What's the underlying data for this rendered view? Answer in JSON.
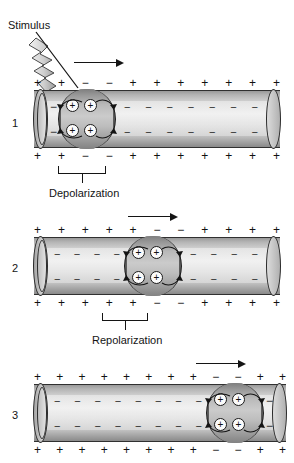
{
  "figure": {
    "stimulus_label": "Stimulus",
    "icons": {
      "lightning": "lightning-bolt-icon",
      "arrow": "right-arrow-icon",
      "ion": "positive-ion-icon"
    },
    "colors": {
      "ink": "#141414",
      "membrane_outline": "#2b2b2b",
      "tube_light": "#efefef",
      "tube_dark": "#8a8a8a",
      "band_dark": "#7e7e7e"
    }
  },
  "panels": [
    {
      "number": "1",
      "region_label": "Depolarization",
      "outside_top": [
        "+",
        "+",
        "−",
        "−",
        "+",
        "+",
        "+",
        "+",
        "+",
        "+",
        "+"
      ],
      "outside_bottom": [
        "+",
        "+",
        "−",
        "−",
        "+",
        "+",
        "+",
        "+",
        "+",
        "+",
        "+"
      ],
      "inside_left_sign": "−",
      "inside_right_sign": "−",
      "ions_top": [
        "+",
        "+"
      ],
      "ions_bottom": [
        "+",
        "+"
      ],
      "direction": "right",
      "has_stimulus": true,
      "band_start_index": 2,
      "band_end_index": 4
    },
    {
      "number": "2",
      "region_label": "Repolarization",
      "outside_top": [
        "+",
        "+",
        "+",
        "+",
        "+",
        "−",
        "−",
        "+",
        "+",
        "+",
        "+"
      ],
      "outside_bottom": [
        "+",
        "+",
        "+",
        "+",
        "+",
        "−",
        "−",
        "+",
        "+",
        "+",
        "+"
      ],
      "inside_left_sign": "−",
      "inside_right_sign": "−",
      "ions_top": [
        "+",
        "+"
      ],
      "ions_bottom": [
        "+",
        "+"
      ],
      "direction": "right",
      "has_stimulus": false,
      "band_start_index": 5,
      "band_end_index": 7
    },
    {
      "number": "3",
      "region_label": "",
      "outside_top": [
        "+",
        "+",
        "+",
        "+",
        "+",
        "+",
        "+",
        "+",
        "−",
        "−",
        "+",
        "+"
      ],
      "outside_bottom": [
        "+",
        "+",
        "+",
        "+",
        "+",
        "+",
        "+",
        "+",
        "−",
        "−",
        "+",
        "+"
      ],
      "inside_left_sign": "−",
      "inside_right_sign": "−",
      "ions_top": [
        "+",
        "+"
      ],
      "ions_bottom": [
        "+",
        "+"
      ],
      "direction": "right",
      "has_stimulus": false,
      "band_start_index": 8,
      "band_end_index": 10
    }
  ],
  "inner_dashes": {
    "sign": "−",
    "panel1_count": 7,
    "panel2_count": 6,
    "panel3_count": 8
  },
  "region_labels": {
    "depolarization": "Depolarization",
    "repolarization": "Repolarization"
  }
}
